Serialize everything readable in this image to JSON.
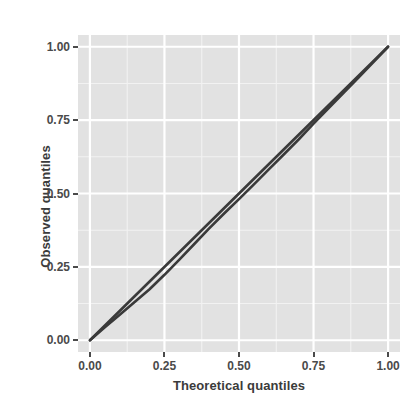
{
  "chart_data": {
    "type": "line",
    "title": "",
    "xlabel": "Theoretical quantiles",
    "ylabel": "Observed quantiles",
    "xlim": [
      -0.04,
      1.04
    ],
    "ylim": [
      -0.04,
      1.04
    ],
    "x_ticks": [
      0.0,
      0.25,
      0.5,
      0.75,
      1.0
    ],
    "y_ticks": [
      0.0,
      0.25,
      0.5,
      0.75,
      1.0
    ],
    "x_tick_labels": [
      "0.00",
      "0.25",
      "0.50",
      "0.75",
      "1.00"
    ],
    "y_tick_labels": [
      "0.00",
      "0.25",
      "0.50",
      "0.75",
      "1.00"
    ],
    "x_minor_ticks": [
      0.125,
      0.375,
      0.625,
      0.875
    ],
    "y_minor_ticks": [
      0.125,
      0.375,
      0.625,
      0.875
    ],
    "grid": true,
    "legend": null,
    "panel_background": "#e2e2e2",
    "grid_major_color": "#ffffff",
    "grid_minor_color": "#f2f2f2",
    "line_color": "#3a3a3a",
    "series": [
      {
        "name": "reference-line",
        "style": "straight-diagonal",
        "x": [
          0.0,
          1.0
        ],
        "values": [
          0.0,
          1.0
        ]
      },
      {
        "name": "observed-quantiles",
        "style": "qq-curve",
        "x": [
          0.0,
          0.05,
          0.1,
          0.15,
          0.2,
          0.25,
          0.3,
          0.35,
          0.4,
          0.45,
          0.5,
          0.55,
          0.6,
          0.65,
          0.7,
          0.75,
          0.8,
          0.85,
          0.9,
          0.95,
          1.0
        ],
        "values": [
          0.0,
          0.044,
          0.087,
          0.13,
          0.174,
          0.223,
          0.275,
          0.328,
          0.381,
          0.432,
          0.481,
          0.531,
          0.582,
          0.633,
          0.684,
          0.738,
          0.79,
          0.842,
          0.894,
          0.947,
          1.0
        ]
      }
    ]
  },
  "axes": {
    "y_title": "Observed quantiles",
    "x_title": "Theoretical quantiles"
  }
}
